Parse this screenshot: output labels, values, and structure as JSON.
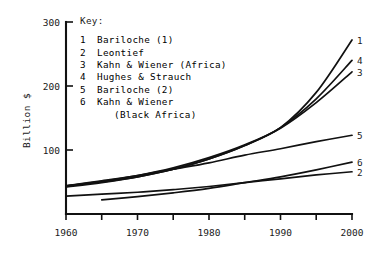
{
  "chart_data": {
    "type": "line",
    "title": "",
    "xlabel": "",
    "ylabel": "Billion $",
    "xlim": [
      1960,
      2000
    ],
    "ylim": [
      0,
      300
    ],
    "xticks": [
      1960,
      1970,
      1980,
      1990,
      2000
    ],
    "xtick_labels": [
      "1960",
      "1970",
      "1980",
      "1990",
      "2000"
    ],
    "yticks": [
      100,
      200,
      300
    ],
    "ytick_labels": [
      "100",
      "200",
      "300"
    ],
    "grid": false,
    "legend_position": "upper-center",
    "legend_title": "Key:",
    "series": [
      {
        "key": "1",
        "name": "Bariloche (1)",
        "end_label": "1",
        "x": [
          1960,
          1965,
          1970,
          1975,
          1980,
          1985,
          1990,
          1995,
          2000
        ],
        "values": [
          44,
          50,
          58,
          70,
          86,
          107,
          135,
          190,
          272
        ]
      },
      {
        "key": "2",
        "name": "Leontief",
        "end_label": "2",
        "x": [
          1960,
          1965,
          1970,
          1975,
          1980,
          1985,
          1990,
          1995,
          2000
        ],
        "values": [
          28,
          31,
          34,
          38,
          43,
          49,
          55,
          61,
          66
        ]
      },
      {
        "key": "3",
        "name": "Kahn & Wiener (Africa)",
        "end_label": "3",
        "x": [
          1960,
          1965,
          1970,
          1975,
          1980,
          1985,
          1990,
          1995,
          2000
        ],
        "values": [
          44,
          51,
          60,
          72,
          88,
          108,
          134,
          174,
          222
        ]
      },
      {
        "key": "4",
        "name": "Hughes & Strauch",
        "end_label": "4",
        "x": [
          1960,
          1965,
          1970,
          1975,
          1980,
          1985,
          1990,
          1995,
          2000
        ],
        "values": [
          42,
          49,
          58,
          70,
          86,
          107,
          135,
          180,
          240
        ]
      },
      {
        "key": "5",
        "name": "Bariloche (2)",
        "end_label": "5",
        "x": [
          1960,
          1965,
          1970,
          1975,
          1980,
          1985,
          1990,
          1995,
          2000
        ],
        "values": [
          44,
          52,
          60,
          70,
          80,
          92,
          102,
          113,
          123
        ]
      },
      {
        "key": "6",
        "name": "Kahn & Wiener",
        "name_line2": "(Black Africa)",
        "end_label": "6",
        "x": [
          1965,
          1970,
          1975,
          1980,
          1985,
          1990,
          1995,
          2000
        ],
        "values": [
          22,
          27,
          33,
          40,
          49,
          58,
          69,
          81
        ]
      }
    ]
  },
  "legend": {
    "title": "Key:",
    "rows": [
      {
        "key": "1",
        "label": "Bariloche (1)"
      },
      {
        "key": "2",
        "label": "Leontief"
      },
      {
        "key": "3",
        "label": "Kahn & Wiener (Africa)"
      },
      {
        "key": "4",
        "label": "Hughes & Strauch"
      },
      {
        "key": "5",
        "label": "Bariloche (2)"
      },
      {
        "key": "6",
        "label": "Kahn & Wiener"
      }
    ],
    "continuation": "(Black Africa)"
  },
  "axes": {
    "y_title": "Billion $",
    "y_labels": [
      "300",
      "200",
      "100"
    ],
    "x_labels": [
      "1960",
      "1970",
      "1980",
      "1990",
      "2000"
    ]
  },
  "curve_end_labels": [
    "1",
    "4",
    "3",
    "5",
    "6",
    "2"
  ],
  "colors": {
    "ink": "#111111",
    "background": "#ffffff"
  }
}
